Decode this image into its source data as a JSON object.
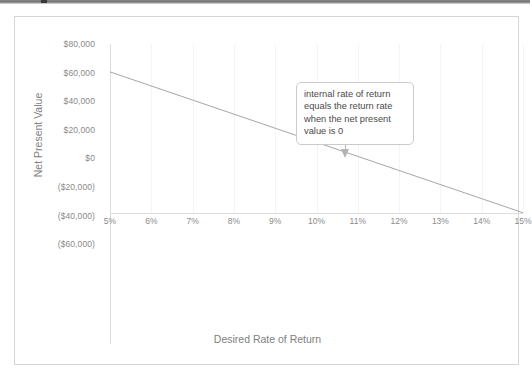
{
  "window": {
    "chrome_visible": true
  },
  "chart_data": {
    "type": "line",
    "title": "",
    "xlabel": "Desired Rate of Return",
    "ylabel": "Net Present Value",
    "xlim": [
      5,
      15
    ],
    "ylim": [
      -60000,
      80000
    ],
    "grid": "vertical-faint",
    "legend": "none",
    "x_tick_labels": [
      "5%",
      "6%",
      "7%",
      "8%",
      "9%",
      "10%",
      "11%",
      "12%",
      "13%",
      "14%",
      "15%"
    ],
    "x_tick_values": [
      5,
      6,
      7,
      8,
      9,
      10,
      11,
      12,
      13,
      14,
      15
    ],
    "y_tick_labels": [
      "$80,000",
      "$60,000",
      "$40,000",
      "$20,000",
      "$0",
      "($20,000)",
      "($40,000)",
      "($60,000)"
    ],
    "y_tick_values": [
      80000,
      60000,
      40000,
      20000,
      0,
      -20000,
      -40000,
      -60000
    ],
    "series": [
      {
        "name": "Net Present Value",
        "color": "#a6a6a6",
        "x": [
          5,
          15
        ],
        "values": [
          60500,
          -38000
        ],
        "points": [
          {
            "x": 5,
            "y": 60500
          },
          {
            "x": 6,
            "y": 50650
          },
          {
            "x": 7,
            "y": 40800
          },
          {
            "x": 8,
            "y": 30950
          },
          {
            "x": 9,
            "y": 21100
          },
          {
            "x": 10,
            "y": 11250
          },
          {
            "x": 10.7,
            "y": 0
          },
          {
            "x": 11,
            "y": 1400
          },
          {
            "x": 12,
            "y": -8450
          },
          {
            "x": 13,
            "y": -18300
          },
          {
            "x": 14,
            "y": -28150
          },
          {
            "x": 15,
            "y": -38000
          }
        ]
      }
    ],
    "annotations": [
      {
        "name": "irr-callout",
        "text": "internal rate of return equals the return rate when the net present value is 0",
        "points_to_x": 10.7,
        "points_to_y": 0
      }
    ]
  },
  "colors": {
    "series_line": "#a6a6a6",
    "axis": "#dcdcdc",
    "gridline": "#f4f4f4",
    "tick_text": "#8a8a8a",
    "axis_title_text": "#808080",
    "callout_border": "#c9ccce",
    "callout_text": "#4a4a4a",
    "chart_border": "#d6d6d6"
  }
}
